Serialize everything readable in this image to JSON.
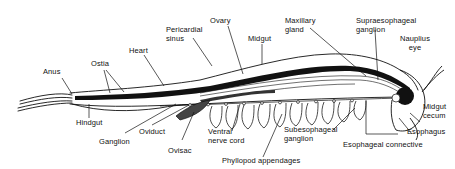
{
  "diagram": {
    "colors": {
      "ink": "#111111",
      "background": "#ffffff"
    },
    "labels": {
      "anus": "Anus",
      "ostia": "Ostia",
      "heart": "Heart",
      "pericardial_sinus_1": "Pericardial",
      "pericardial_sinus_2": "sinus",
      "ovary": "Ovary",
      "midgut": "Midgut",
      "maxillary_gland_1": "Maxillary",
      "maxillary_gland_2": "gland",
      "supraesophageal_ganglion_1": "Supraesophageal",
      "supraesophageal_ganglion_2": "ganglion",
      "nauplius_eye_1": "Nauplius",
      "nauplius_eye_2": "eye",
      "hindgut": "Hindgut",
      "ganglion": "Ganglion",
      "oviduct": "Oviduct",
      "ovisac": "Ovisac",
      "ventral_nerve_cord_1": "Ventral",
      "ventral_nerve_cord_2": "nerve cord",
      "phyllopod_appendages": "Phyllopod appendages",
      "subesophageal_ganglion_1": "Subesophageal",
      "subesophageal_ganglion_2": "ganglion",
      "midgut_cecum_1": "Midgut",
      "midgut_cecum_2": "cecum",
      "esophagus": "Esophagus",
      "esophageal_connective": "Esophageal connective"
    }
  }
}
